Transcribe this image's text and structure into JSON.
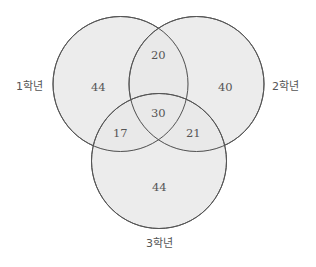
{
  "diagram": {
    "type": "venn",
    "sets": [
      {
        "id": "A",
        "label": "1학년"
      },
      {
        "id": "B",
        "label": "2학년"
      },
      {
        "id": "C",
        "label": "3학년"
      }
    ],
    "regions": {
      "only_1": "44",
      "only_2": "40",
      "only_3": "44",
      "1_and_2": "20",
      "1_and_3": "17",
      "2_and_3": "21",
      "all_three": "30"
    },
    "colors": {
      "fill": "#e9e9e9",
      "stroke": "#555555",
      "text": "#555555"
    }
  }
}
